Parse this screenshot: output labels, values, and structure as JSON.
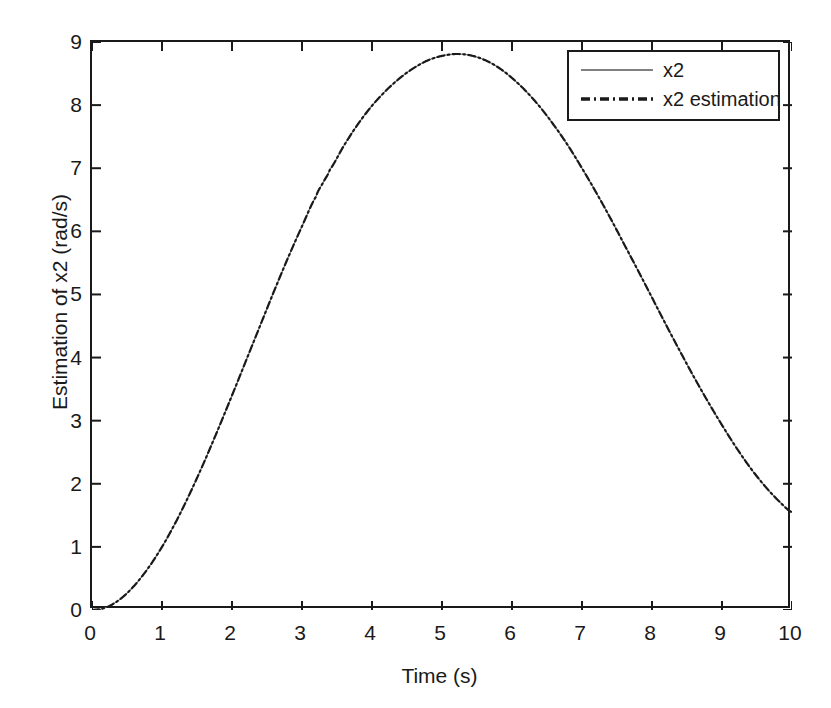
{
  "figure": {
    "background_color": "#ffffff",
    "axis_color": "#1a1a1a"
  },
  "chart_data": {
    "type": "line",
    "title": "",
    "xlabel": "Time (s)",
    "ylabel": "Estimation of x2 (rad/s)",
    "xlim": [
      0,
      10
    ],
    "ylim": [
      0,
      9
    ],
    "xticks": [
      0,
      1,
      2,
      3,
      4,
      5,
      6,
      7,
      8,
      9,
      10
    ],
    "yticks": [
      0,
      1,
      2,
      3,
      4,
      5,
      6,
      7,
      8,
      9
    ],
    "grid": false,
    "legend_position": "upper right",
    "annotations": [],
    "series": [
      {
        "name": "x2",
        "color": "#808080",
        "linestyle": "solid",
        "linewidth": 1.2,
        "x": [
          0.0,
          0.2,
          0.4,
          0.6,
          0.8,
          1.0,
          1.2,
          1.4,
          1.6,
          1.8,
          2.0,
          2.2,
          2.4,
          2.6,
          2.8,
          3.0,
          3.2,
          3.3,
          3.4,
          3.6,
          3.8,
          4.0,
          4.2,
          4.4,
          4.6,
          4.8,
          5.0,
          5.2,
          5.4,
          5.6,
          5.8,
          6.0,
          6.2,
          6.4,
          6.6,
          6.8,
          7.0,
          7.2,
          7.4,
          7.6,
          7.8,
          8.0,
          8.2,
          8.4,
          8.6,
          8.8,
          9.0,
          9.2,
          9.4,
          9.6,
          9.8,
          10.0
        ],
        "y": [
          0.0,
          0.04,
          0.17,
          0.38,
          0.66,
          1.0,
          1.4,
          1.85,
          2.34,
          2.86,
          3.4,
          3.95,
          4.5,
          5.05,
          5.58,
          6.08,
          6.55,
          6.77,
          6.98,
          7.36,
          7.7,
          7.99,
          8.23,
          8.43,
          8.59,
          8.71,
          8.78,
          8.81,
          8.79,
          8.72,
          8.6,
          8.43,
          8.22,
          7.97,
          7.68,
          7.36,
          7.0,
          6.62,
          6.22,
          5.8,
          5.38,
          4.95,
          4.52,
          4.1,
          3.69,
          3.3,
          2.93,
          2.58,
          2.26,
          1.98,
          1.74,
          1.55
        ]
      },
      {
        "name": "x2 estimation",
        "color": "#1a1a1a",
        "linestyle": "dashdot",
        "linewidth": 2.2,
        "x": [
          0.0,
          0.2,
          0.4,
          0.6,
          0.8,
          1.0,
          1.2,
          1.4,
          1.6,
          1.8,
          2.0,
          2.2,
          2.4,
          2.6,
          2.8,
          3.0,
          3.2,
          3.3,
          3.4,
          3.6,
          3.8,
          4.0,
          4.2,
          4.4,
          4.6,
          4.8,
          5.0,
          5.2,
          5.4,
          5.6,
          5.8,
          6.0,
          6.2,
          6.4,
          6.6,
          6.8,
          7.0,
          7.2,
          7.4,
          7.6,
          7.8,
          8.0,
          8.2,
          8.4,
          8.6,
          8.8,
          9.0,
          9.2,
          9.4,
          9.6,
          9.8,
          10.0
        ],
        "y": [
          0.0,
          0.04,
          0.17,
          0.38,
          0.66,
          1.0,
          1.4,
          1.85,
          2.34,
          2.86,
          3.4,
          3.95,
          4.5,
          5.05,
          5.58,
          6.08,
          6.55,
          6.77,
          6.98,
          7.36,
          7.7,
          7.99,
          8.23,
          8.43,
          8.59,
          8.71,
          8.78,
          8.81,
          8.79,
          8.72,
          8.6,
          8.43,
          8.22,
          7.97,
          7.68,
          7.36,
          7.0,
          6.62,
          6.22,
          5.8,
          5.38,
          4.95,
          4.52,
          4.1,
          3.69,
          3.3,
          2.93,
          2.58,
          2.26,
          1.98,
          1.74,
          1.55
        ]
      }
    ],
    "curve_description": {
      "shape": "damped-free sinusoidal rise then oscillation",
      "start_value": 0.0,
      "peak_value": 8.8,
      "peak_time": 3.3,
      "trough_value": 1.47,
      "trough_time": 6.4,
      "end_value": 7.8,
      "end_time": 10.0
    }
  },
  "axes": {
    "x_tick_labels": [
      "0",
      "1",
      "2",
      "3",
      "4",
      "5",
      "6",
      "7",
      "8",
      "9",
      "10"
    ],
    "y_tick_labels": [
      "0",
      "1",
      "2",
      "3",
      "4",
      "5",
      "6",
      "7",
      "8",
      "9"
    ],
    "x_title": "Time (s)",
    "y_title": "Estimation of x2 (rad/s)"
  },
  "legend": {
    "entries": [
      {
        "label": "x2",
        "style": "solid",
        "color": "#808080"
      },
      {
        "label": "x2 estimation",
        "style": "dashdot",
        "color": "#1a1a1a"
      }
    ]
  },
  "page_caption": ""
}
